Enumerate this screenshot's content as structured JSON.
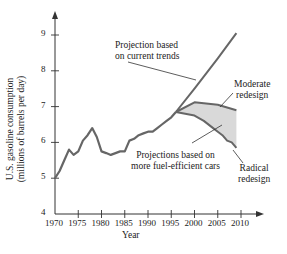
{
  "chart_data": {
    "type": "line",
    "title": "",
    "xlabel": "Year",
    "ylabel": "U.S. gasoline consumption (millions of barrels per day)",
    "xlim": [
      1970,
      2012
    ],
    "ylim": [
      4,
      9.6
    ],
    "x_ticks": [
      1970,
      1975,
      1980,
      1985,
      1990,
      1995,
      2000,
      2005,
      2010
    ],
    "y_ticks": [
      4,
      5,
      6,
      7,
      8,
      9
    ],
    "grid": false,
    "series": [
      {
        "name": "Historical",
        "x": [
          1970,
          1971,
          1972,
          1973,
          1974,
          1975,
          1976,
          1977,
          1978,
          1979,
          1980,
          1981,
          1982,
          1983,
          1984,
          1985,
          1986,
          1987,
          1988,
          1989,
          1990,
          1991,
          1992,
          1993,
          1994,
          1995,
          1996
        ],
        "values": [
          5.0,
          5.2,
          5.5,
          5.8,
          5.65,
          5.75,
          6.05,
          6.2,
          6.4,
          6.15,
          5.75,
          5.7,
          5.65,
          5.7,
          5.75,
          5.75,
          6.05,
          6.1,
          6.2,
          6.25,
          6.3,
          6.3,
          6.4,
          6.5,
          6.6,
          6.7,
          6.85
        ]
      },
      {
        "name": "Projection based on current trends",
        "x": [
          1996,
          2000,
          2005,
          2009
        ],
        "values": [
          6.85,
          7.5,
          8.35,
          9.05
        ]
      },
      {
        "name": "Moderate redesign",
        "x": [
          1996,
          2000,
          2005,
          2009
        ],
        "values": [
          6.85,
          7.12,
          7.05,
          6.9
        ]
      },
      {
        "name": "Radical redesign",
        "x": [
          1996,
          2000,
          2002,
          2004,
          2005,
          2006,
          2007,
          2008,
          2009
        ],
        "values": [
          6.85,
          6.75,
          6.6,
          6.4,
          6.3,
          6.2,
          6.05,
          6.0,
          5.85
        ]
      }
    ],
    "annotations": [
      {
        "text": "Projection based on current trends",
        "target": "Projection based on current trends"
      },
      {
        "text": "Moderate redesign",
        "target": "Moderate redesign"
      },
      {
        "text": "Radical redesign",
        "target": "Radical redesign"
      },
      {
        "text": "Projections based on more fuel-efficient cars",
        "target": "shaded region between moderate and radical redesign"
      }
    ],
    "shaded_region": {
      "between": [
        "Moderate redesign",
        "Radical redesign"
      ],
      "color": "#d9d9d9"
    }
  },
  "labels": {
    "y_axis_line1": "U.S. gasoline consumption",
    "y_axis_line2": "(millions of barrels per day)",
    "x_axis": "Year",
    "proj_line1": "Projection based",
    "proj_line2": "on current trends",
    "moderate_line1": "Moderate",
    "moderate_line2": "redesign",
    "radical_line1": "Radical",
    "radical_line2": "redesign",
    "fuel_line1": "Projections based on",
    "fuel_line2": "more fuel-efficient cars",
    "xt": [
      "1970",
      "1975",
      "1980",
      "1985",
      "1990",
      "1995",
      "2000",
      "2005",
      "2010"
    ],
    "yt": [
      "4",
      "5",
      "6",
      "7",
      "8",
      "9"
    ]
  },
  "colors": {
    "line": "#666666",
    "shade": "#d9d9d9",
    "axis": "#333333"
  }
}
